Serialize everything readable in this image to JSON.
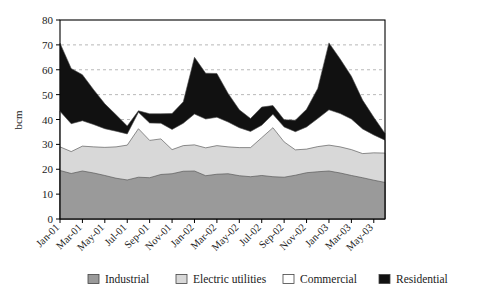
{
  "chart_data": {
    "type": "area",
    "stacked": true,
    "title": "",
    "subtitle": "",
    "xlabel": "",
    "ylabel": "bcm",
    "ylim": [
      0,
      80
    ],
    "ytick_values": [
      0,
      10,
      20,
      30,
      40,
      50,
      60,
      70,
      80
    ],
    "ytick_labels": [
      "0",
      "10",
      "20",
      "30",
      "40",
      "50",
      "60",
      "70",
      "80"
    ],
    "grid": "horizontal-dashed",
    "legend_position": "bottom",
    "x": [
      "Jan-01",
      "Feb-01",
      "Mar-01",
      "Apr-01",
      "May-01",
      "Jun-01",
      "Jul-01",
      "Aug-01",
      "Sep-01",
      "Oct-01",
      "Nov-01",
      "Dec-01",
      "Jan-02",
      "Feb-02",
      "Mar-02",
      "Apr-02",
      "May-02",
      "Jun-02",
      "Jul-02",
      "Aug-02",
      "Sep-02",
      "Oct-02",
      "Nov-02",
      "Dec-02",
      "Jan-03",
      "Feb-03",
      "Mar-03",
      "Apr-03",
      "May-03",
      "Jun-03"
    ],
    "xtick_labels": [
      "Jan-01",
      "Mar-01",
      "May-01",
      "Jul-01",
      "Sep-01",
      "Nov-01",
      "Jan-02",
      "Mar-02",
      "May-02",
      "Jul-02",
      "Sep-02",
      "Nov-02",
      "Jan-03",
      "Mar-03",
      "May-03"
    ],
    "categories": [
      "Jan-01",
      "Feb-01",
      "Mar-01",
      "Apr-01",
      "May-01",
      "Jun-01",
      "Jul-01",
      "Aug-01",
      "Sep-01",
      "Oct-01",
      "Nov-01",
      "Dec-01",
      "Jan-02",
      "Feb-02",
      "Mar-02",
      "Apr-02",
      "May-02",
      "Jun-02",
      "Jul-02",
      "Aug-02",
      "Sep-02",
      "Oct-02",
      "Nov-02",
      "Dec-02",
      "Jan-03",
      "Feb-03",
      "Mar-03",
      "Apr-03",
      "May-03",
      "Jun-03"
    ],
    "series": [
      {
        "name": "Industrial",
        "color": "#9a9a9a",
        "values": [
          19.5,
          18.3,
          19.3,
          18.5,
          17.5,
          16.4,
          15.7,
          16.8,
          16.6,
          17.9,
          18.2,
          19.2,
          19.3,
          17.4,
          18.0,
          18.2,
          17.4,
          17.0,
          17.5,
          17.0,
          16.8,
          17.6,
          18.6,
          19.0,
          19.3,
          18.5,
          17.5,
          16.6,
          15.6,
          14.7
        ]
      },
      {
        "name": "Electric utilities",
        "color": "#d8d8d8",
        "values": [
          9.5,
          8.8,
          10.0,
          10.5,
          11.3,
          12.6,
          14.0,
          19.5,
          15.0,
          14.3,
          9.7,
          10.3,
          10.5,
          11.2,
          11.5,
          10.8,
          11.3,
          11.7,
          15.2,
          19.7,
          14.2,
          10.2,
          9.5,
          10.1,
          10.4,
          10.5,
          10.4,
          9.7,
          11.0,
          11.8
        ]
      },
      {
        "name": "Commercial",
        "color": "#ffffff",
        "values": [
          14.3,
          11.2,
          10.2,
          9.0,
          7.5,
          6.3,
          4.5,
          6.6,
          7.0,
          6.3,
          8.1,
          9.0,
          12.4,
          11.6,
          11.4,
          10.0,
          8.0,
          6.5,
          5.0,
          5.4,
          6.0,
          7.3,
          8.9,
          11.3,
          14.2,
          13.4,
          12.3,
          9.9,
          7.2,
          5.2
        ]
      },
      {
        "name": "Residential",
        "color": "#111111",
        "values": [
          27.4,
          22.2,
          18.5,
          14.0,
          10.0,
          6.6,
          3.2,
          0.6,
          3.7,
          3.8,
          6.4,
          8.6,
          22.8,
          18.4,
          17.6,
          11.5,
          7.2,
          5.2,
          7.3,
          3.5,
          2.9,
          4.6,
          7.1,
          12.1,
          26.9,
          21.9,
          17.2,
          11.6,
          7.1,
          2.7
        ]
      }
    ],
    "totals": [
      70.7,
      60.5,
      58.0,
      52.0,
      46.3,
      41.9,
      37.4,
      43.5,
      42.3,
      42.3,
      42.4,
      47.1,
      65.0,
      58.6,
      58.5,
      50.5,
      43.9,
      40.4,
      45.0,
      45.6,
      39.9,
      39.7,
      44.1,
      52.5,
      70.8,
      64.3,
      57.4,
      47.8,
      40.9,
      34.4
    ]
  },
  "legend": {
    "items": [
      {
        "label": "Industrial",
        "color": "#9a9a9a"
      },
      {
        "label": "Electric utilities",
        "color": "#d8d8d8"
      },
      {
        "label": "Commercial",
        "color": "#ffffff"
      },
      {
        "label": "Residential",
        "color": "#111111"
      }
    ]
  },
  "axes": {
    "y_title": "bcm"
  }
}
